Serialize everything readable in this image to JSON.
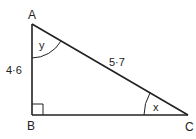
{
  "diagram": {
    "type": "right-triangle",
    "vertices": {
      "A": {
        "label": "A"
      },
      "B": {
        "label": "B"
      },
      "C": {
        "label": "C"
      }
    },
    "sides": {
      "AB": "4·6",
      "AC": "5·7"
    },
    "angles": {
      "A": "y",
      "C": "x",
      "B": "right angle"
    },
    "line_color": "#222222"
  }
}
